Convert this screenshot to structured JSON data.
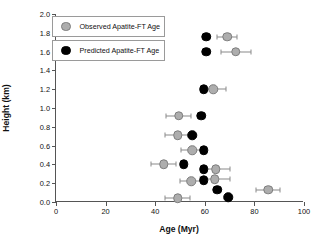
{
  "chart_data": {
    "type": "scatter",
    "title": "",
    "xlabel": "Age (Myr)",
    "ylabel": "Height (km)",
    "xlim": [
      0,
      100
    ],
    "ylim": [
      0.0,
      2.0
    ],
    "xticks": [
      0,
      20,
      40,
      60,
      80,
      100
    ],
    "xtick_labels": [
      "0",
      "20",
      "40",
      "60",
      "80",
      "100"
    ],
    "yticks": [
      0.0,
      0.2,
      0.4,
      0.6,
      0.8,
      1.0,
      1.2,
      1.4,
      1.6,
      1.8,
      2.0
    ],
    "ytick_labels": [
      "0.0",
      "0.2",
      "0.4",
      "0.6",
      "0.8",
      "1.0",
      "1.2",
      "1.4",
      "1.6",
      "1.8",
      "2.0"
    ],
    "grid": false,
    "legend_position": "upper-left",
    "series": [
      {
        "name": "Observed Apatite-FT Age",
        "marker": "circle",
        "color": "#adadad",
        "edge_color": "#7d7d7d",
        "has_error_bars": true,
        "points": [
          {
            "x": 69.0,
            "y": 1.76,
            "xerr": 4.0
          },
          {
            "x": 72.5,
            "y": 1.6,
            "xerr": 6.0
          },
          {
            "x": 63.5,
            "y": 1.2,
            "xerr": 5.0
          },
          {
            "x": 49.5,
            "y": 0.92,
            "xerr": 5.0
          },
          {
            "x": 49.0,
            "y": 0.71,
            "xerr": 5.0
          },
          {
            "x": 55.0,
            "y": 0.55,
            "xerr": 4.5
          },
          {
            "x": 43.5,
            "y": 0.4,
            "xerr": 5.0
          },
          {
            "x": 64.5,
            "y": 0.35,
            "xerr": 5.5
          },
          {
            "x": 64.0,
            "y": 0.24,
            "xerr": 6.0
          },
          {
            "x": 54.5,
            "y": 0.22,
            "xerr": 4.5
          },
          {
            "x": 85.5,
            "y": 0.13,
            "xerr": 5.0
          },
          {
            "x": 49.0,
            "y": 0.04,
            "xerr": 5.0
          }
        ]
      },
      {
        "name": "Predicted Apatite-FT Age",
        "marker": "circle",
        "color": "#000000",
        "edge_color": "#000000",
        "has_error_bars": false,
        "points": [
          {
            "x": 60.5,
            "y": 1.76
          },
          {
            "x": 60.5,
            "y": 1.6
          },
          {
            "x": 59.5,
            "y": 1.2
          },
          {
            "x": 58.5,
            "y": 0.92
          },
          {
            "x": 55.0,
            "y": 0.71
          },
          {
            "x": 59.5,
            "y": 0.55
          },
          {
            "x": 51.5,
            "y": 0.4
          },
          {
            "x": 59.5,
            "y": 0.35
          },
          {
            "x": 59.5,
            "y": 0.23
          },
          {
            "x": 65.0,
            "y": 0.13
          },
          {
            "x": 69.5,
            "y": 0.05
          }
        ]
      }
    ]
  },
  "legend": {
    "observed_label": "Observed Apatite-FT Age",
    "predicted_label": "Predicted Apatite-FT Age"
  },
  "colors": {
    "observed": "#adadad",
    "predicted": "#000000",
    "axis": "#555555",
    "error_bar": "#8a8a8a"
  }
}
